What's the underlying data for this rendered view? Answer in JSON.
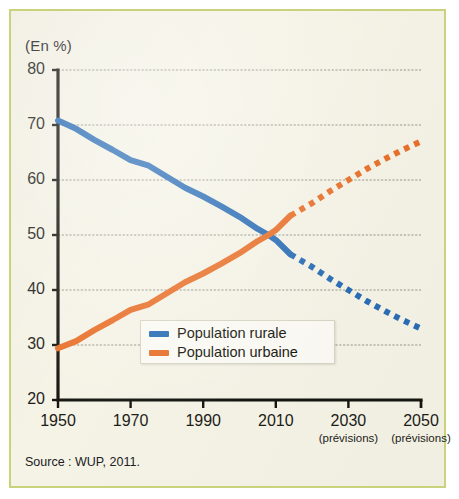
{
  "figure": {
    "unit_label": "(En %)",
    "source": "Source : WUP, 2011.",
    "background_color": "#f5f3e6",
    "border_color": "#c8d37c"
  },
  "legend": {
    "position": "inside-center-lower",
    "entries": [
      {
        "label": "Population rurale",
        "color": "#2a6db5"
      },
      {
        "label": "Population urbaine",
        "color": "#e8702a"
      }
    ]
  },
  "chart_data": {
    "type": "line",
    "title": "",
    "subtitle": "",
    "xlabel": "",
    "ylabel": "(En %)",
    "xlim": [
      1950,
      2050
    ],
    "ylim": [
      20,
      80
    ],
    "grid": true,
    "legend_position": "center",
    "yticks": [
      20,
      30,
      40,
      50,
      60,
      70,
      80
    ],
    "ytick_labels": [
      "20",
      "30",
      "40",
      "50",
      "60",
      "70",
      "80"
    ],
    "xticks": [
      1950,
      1970,
      1990,
      2010,
      2030,
      2050
    ],
    "xtick_labels": [
      "1950",
      "1970",
      "1990",
      "2010",
      "2030",
      "2050"
    ],
    "xtick_sublabels": [
      "",
      "",
      "",
      "",
      "(prévisions)",
      "(prévisions)"
    ],
    "forecast_start_year": 2014,
    "crossover": {
      "year": 2008,
      "value": 50
    },
    "annotations": [
      "Source : WUP, 2011."
    ],
    "series": [
      {
        "name": "Population rurale",
        "color": "#2a6db5",
        "style_solid": "solid",
        "style_forecast": "dotted",
        "x": [
          1950,
          1955,
          1960,
          1965,
          1970,
          1975,
          1980,
          1985,
          1990,
          1995,
          2000,
          2005,
          2008,
          2010,
          2014,
          2020,
          2025,
          2030,
          2035,
          2040,
          2045,
          2050
        ],
        "values": [
          70.8,
          69.3,
          67.3,
          65.5,
          63.6,
          62.6,
          60.6,
          58.6,
          57.0,
          55.2,
          53.3,
          51.1,
          50.0,
          49.1,
          46.5,
          44.2,
          42.0,
          40.0,
          38.0,
          36.2,
          34.5,
          33.0
        ]
      },
      {
        "name": "Population urbaine",
        "color": "#e8702a",
        "style_solid": "solid",
        "style_forecast": "dotted",
        "x": [
          1950,
          1955,
          1960,
          1965,
          1970,
          1975,
          1980,
          1985,
          1990,
          1995,
          2000,
          2005,
          2008,
          2010,
          2014,
          2020,
          2025,
          2030,
          2035,
          2040,
          2045,
          2050
        ],
        "values": [
          29.4,
          30.7,
          32.7,
          34.5,
          36.4,
          37.4,
          39.4,
          41.4,
          43.0,
          44.8,
          46.7,
          48.9,
          50.0,
          50.9,
          53.5,
          55.8,
          58.0,
          60.0,
          62.0,
          63.8,
          65.5,
          67.0
        ]
      }
    ]
  }
}
